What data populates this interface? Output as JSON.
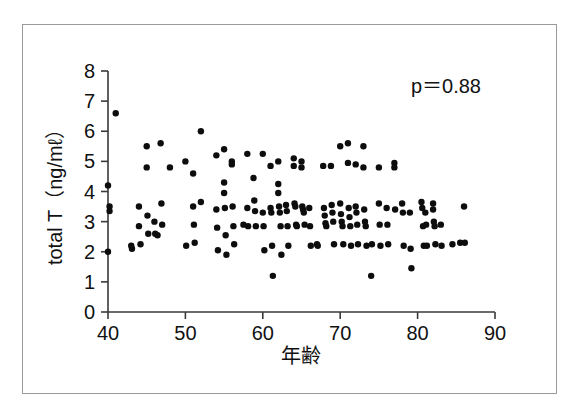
{
  "figure": {
    "background_color": "#ffffff",
    "frame_color": "#9a9a9a",
    "axis_color": "#3a3a3a",
    "marker_color": "#0d0d0d"
  },
  "annotation": {
    "p_value_label": "p＝0.88"
  },
  "chart_data": {
    "type": "scatter",
    "title": "",
    "xlabel": "年齢",
    "ylabel": "total T（ng/mℓ）",
    "xlim": [
      40,
      90
    ],
    "ylim": [
      0,
      8
    ],
    "xticks": [
      40,
      50,
      60,
      70,
      80,
      90
    ],
    "xticklabels": [
      "40",
      "50",
      "60",
      "70",
      "80",
      "90"
    ],
    "yticks": [
      0,
      1,
      2,
      3,
      4,
      5,
      6,
      7,
      8
    ],
    "yticklabels": [
      "0",
      "1",
      "2",
      "3",
      "4",
      "5",
      "6",
      "7",
      "8"
    ],
    "grid": false,
    "legend": null,
    "annotations": [
      {
        "text": "p＝0.88",
        "x": 82.5,
        "y": 7.3
      }
    ],
    "marker": {
      "shape": "circle",
      "size_px": 6.4,
      "color": "#0d0d0d"
    },
    "series": [
      {
        "name": "total testosterone vs age",
        "points": [
          [
            40.0,
            4.2
          ],
          [
            40.0,
            2.0
          ],
          [
            40.2,
            3.5
          ],
          [
            40.2,
            3.35
          ],
          [
            41.0,
            6.6
          ],
          [
            43.0,
            2.2
          ],
          [
            43.1,
            2.1
          ],
          [
            44.0,
            3.5
          ],
          [
            44.0,
            2.85
          ],
          [
            44.2,
            2.25
          ],
          [
            45.0,
            5.5
          ],
          [
            45.0,
            4.8
          ],
          [
            45.1,
            3.2
          ],
          [
            45.2,
            2.6
          ],
          [
            46.0,
            3.0
          ],
          [
            46.1,
            2.6
          ],
          [
            46.4,
            2.55
          ],
          [
            46.8,
            5.6
          ],
          [
            46.9,
            3.6
          ],
          [
            47.0,
            2.9
          ],
          [
            48.0,
            4.8
          ],
          [
            50.0,
            5.0
          ],
          [
            50.1,
            2.2
          ],
          [
            51.0,
            4.6
          ],
          [
            51.0,
            3.5
          ],
          [
            51.1,
            2.9
          ],
          [
            51.2,
            2.3
          ],
          [
            52.0,
            6.0
          ],
          [
            52.0,
            3.65
          ],
          [
            54.0,
            5.2
          ],
          [
            54.0,
            3.4
          ],
          [
            54.1,
            2.8
          ],
          [
            54.2,
            2.05
          ],
          [
            55.0,
            5.4
          ],
          [
            55.0,
            4.3
          ],
          [
            55.0,
            3.95
          ],
          [
            55.1,
            3.45
          ],
          [
            55.2,
            2.55
          ],
          [
            55.3,
            1.9
          ],
          [
            56.0,
            5.0
          ],
          [
            56.0,
            4.9
          ],
          [
            56.1,
            3.5
          ],
          [
            56.2,
            2.85
          ],
          [
            56.3,
            2.25
          ],
          [
            57.5,
            2.9
          ],
          [
            58.0,
            5.25
          ],
          [
            58.0,
            3.45
          ],
          [
            58.1,
            2.85
          ],
          [
            58.8,
            4.45
          ],
          [
            58.9,
            3.7
          ],
          [
            59.0,
            3.35
          ],
          [
            59.1,
            2.85
          ],
          [
            60.0,
            5.25
          ],
          [
            60.0,
            3.3
          ],
          [
            60.1,
            2.85
          ],
          [
            60.2,
            2.05
          ],
          [
            61.0,
            4.85
          ],
          [
            61.0,
            3.45
          ],
          [
            61.1,
            3.3
          ],
          [
            61.2,
            2.2
          ],
          [
            61.3,
            1.2
          ],
          [
            62.0,
            5.0
          ],
          [
            62.0,
            4.25
          ],
          [
            62.0,
            3.95
          ],
          [
            62.1,
            3.5
          ],
          [
            62.2,
            3.3
          ],
          [
            62.3,
            2.85
          ],
          [
            62.4,
            1.9
          ],
          [
            63.0,
            3.55
          ],
          [
            63.1,
            3.35
          ],
          [
            63.2,
            2.85
          ],
          [
            63.3,
            2.2
          ],
          [
            64.0,
            5.1
          ],
          [
            64.0,
            4.85
          ],
          [
            64.1,
            3.6
          ],
          [
            64.2,
            3.5
          ],
          [
            64.3,
            2.9
          ],
          [
            64.4,
            2.85
          ],
          [
            65.0,
            5.0
          ],
          [
            65.0,
            4.8
          ],
          [
            65.1,
            3.5
          ],
          [
            65.2,
            3.4
          ],
          [
            65.3,
            3.3
          ],
          [
            65.4,
            2.9
          ],
          [
            66.0,
            3.45
          ],
          [
            66.1,
            2.85
          ],
          [
            66.2,
            2.2
          ],
          [
            67.0,
            2.25
          ],
          [
            67.1,
            2.2
          ],
          [
            67.8,
            4.85
          ],
          [
            67.9,
            3.45
          ],
          [
            68.0,
            3.2
          ],
          [
            68.1,
            2.95
          ],
          [
            68.2,
            2.85
          ],
          [
            68.8,
            4.85
          ],
          [
            68.9,
            3.55
          ],
          [
            69.0,
            3.3
          ],
          [
            69.1,
            3.0
          ],
          [
            69.2,
            2.25
          ],
          [
            70.0,
            5.5
          ],
          [
            70.0,
            3.6
          ],
          [
            70.1,
            3.25
          ],
          [
            70.2,
            3.0
          ],
          [
            70.3,
            2.85
          ],
          [
            70.4,
            2.25
          ],
          [
            71.0,
            5.6
          ],
          [
            71.0,
            4.95
          ],
          [
            71.1,
            3.45
          ],
          [
            71.2,
            3.15
          ],
          [
            71.3,
            2.85
          ],
          [
            71.4,
            2.2
          ],
          [
            72.0,
            4.9
          ],
          [
            72.0,
            3.5
          ],
          [
            72.1,
            3.3
          ],
          [
            72.2,
            2.9
          ],
          [
            72.3,
            2.25
          ],
          [
            73.0,
            5.5
          ],
          [
            73.0,
            4.8
          ],
          [
            73.1,
            3.4
          ],
          [
            73.2,
            3.0
          ],
          [
            73.3,
            2.85
          ],
          [
            73.4,
            2.2
          ],
          [
            74.0,
            1.2
          ],
          [
            74.1,
            2.25
          ],
          [
            75.0,
            4.8
          ],
          [
            75.0,
            3.6
          ],
          [
            75.1,
            2.9
          ],
          [
            75.2,
            2.2
          ],
          [
            76.0,
            3.45
          ],
          [
            76.1,
            2.9
          ],
          [
            76.2,
            2.25
          ],
          [
            77.0,
            4.95
          ],
          [
            77.0,
            4.8
          ],
          [
            77.1,
            3.4
          ],
          [
            78.0,
            3.6
          ],
          [
            78.1,
            3.3
          ],
          [
            78.2,
            2.2
          ],
          [
            79.0,
            3.3
          ],
          [
            79.1,
            2.1
          ],
          [
            79.2,
            1.45
          ],
          [
            80.5,
            3.65
          ],
          [
            80.6,
            3.45
          ],
          [
            80.7,
            2.85
          ],
          [
            80.8,
            2.2
          ],
          [
            81.0,
            3.3
          ],
          [
            81.1,
            2.9
          ],
          [
            81.2,
            2.2
          ],
          [
            82.0,
            3.6
          ],
          [
            82.0,
            3.4
          ],
          [
            82.1,
            3.0
          ],
          [
            82.2,
            2.85
          ],
          [
            82.3,
            2.25
          ],
          [
            83.0,
            2.9
          ],
          [
            83.1,
            2.2
          ],
          [
            84.5,
            2.25
          ],
          [
            85.5,
            2.3
          ],
          [
            86.0,
            3.5
          ],
          [
            86.1,
            2.3
          ]
        ]
      }
    ]
  }
}
